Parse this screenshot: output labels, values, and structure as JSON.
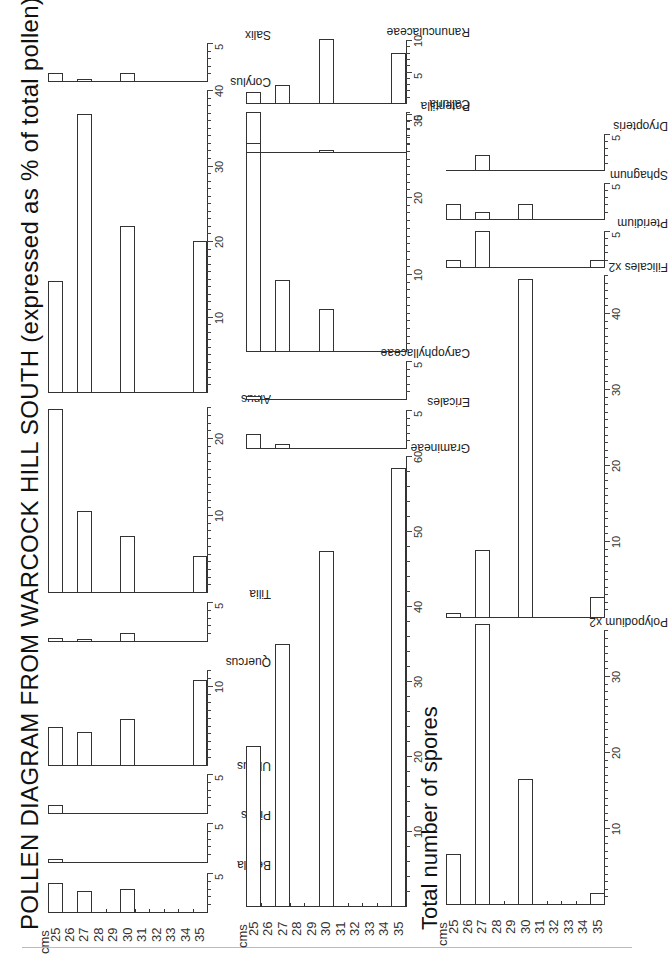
{
  "title": "POLLEN DIAGRAM FROM WARCOCK HILL SOUTH (expressed as % of total pollen)",
  "spores_title": "Total number of spores",
  "depth_unit_label": "cms",
  "chart_data": {
    "type": "bar",
    "title": "POLLEN DIAGRAM FROM WARCOCK HILL SOUTH (expressed as % of total pollen)",
    "orientation": "figure rotated 90deg counter-clockwise; depth axis horizontal, values increase upward",
    "xlabel": "cms",
    "depths": [
      25,
      26,
      27,
      28,
      29,
      30,
      31,
      32,
      33,
      34,
      35
    ],
    "columns": [
      {
        "name": "trees-shrubs",
        "x0": 48,
        "step": 14.45,
        "panels": [
          {
            "taxon": "Betula",
            "baseline": 912,
            "ppu": 7.8,
            "max_tick": 5,
            "minor": 1,
            "label_ticks": [
              5
            ],
            "values": {
              "25": 3.7,
              "27": 2.7,
              "30": 3.0
            }
          },
          {
            "taxon": "Pinus",
            "baseline": 862,
            "ppu": 7.8,
            "max_tick": 5,
            "minor": 1,
            "label_ticks": [
              5
            ],
            "values": {
              "25": 0.4
            }
          },
          {
            "taxon": "Ulmus",
            "baseline": 813,
            "ppu": 7.8,
            "max_tick": 5,
            "minor": 1,
            "label_ticks": [
              5
            ],
            "values": {
              "25": 1.0
            }
          },
          {
            "taxon": "Quercus",
            "baseline": 765,
            "ppu": 7.9,
            "max_tick": 12,
            "minor": 1,
            "label_ticks": [
              10
            ],
            "values": {
              "25": 4.8,
              "27": 4.2,
              "30": 5.8,
              "35": 10.8
            }
          },
          {
            "taxon": "Tilia",
            "baseline": 641,
            "ppu": 7.8,
            "max_tick": 5,
            "minor": 1,
            "label_ticks": [
              5
            ],
            "values": {
              "25": 0.4,
              "27": 0.3,
              "30": 1.0
            }
          },
          {
            "taxon": "Alnus",
            "baseline": 592,
            "ppu": 7.7,
            "max_tick": 24,
            "minor": 1,
            "label_ticks": [
              10,
              20
            ],
            "values": {
              "25": 23.8,
              "27": 10.5,
              "30": 7.3,
              "35": 4.7
            }
          },
          {
            "taxon": "Corylus",
            "baseline": 392,
            "ppu": 7.55,
            "max_tick": 40,
            "minor": 1,
            "label_ticks": [
              10,
              20,
              30,
              40
            ],
            "values": {
              "25": 14.7,
              "27": 36.8,
              "30": 22.0,
              "35": 20.0
            }
          },
          {
            "taxon": "Salix",
            "baseline": 81,
            "ppu": 7.6,
            "max_tick": 5,
            "minor": 1,
            "label_ticks": [
              5
            ],
            "values": {
              "25": 1.0,
              "27": 0.3,
              "30": 1.0
            }
          }
        ]
      },
      {
        "name": "herbs",
        "x0": 246,
        "step": 14.5,
        "panels": [
          {
            "taxon": "Gramineae",
            "baseline": 906,
            "ppu": 7.5,
            "max_tick": 60,
            "minor": 2,
            "label_ticks": [
              10,
              20,
              30,
              40,
              50,
              60
            ],
            "values": {
              "25": 21.3,
              "27": 34.9,
              "30": 47.3,
              "35": 58.4
            }
          },
          {
            "taxon": "Ericales",
            "baseline": 448,
            "ppu": 7.6,
            "max_tick": 5,
            "minor": 1,
            "label_ticks": [
              5
            ],
            "values": {
              "25": 1.8,
              "27": 0.5
            }
          },
          {
            "taxon": "Caryophyllaceae",
            "baseline": 399,
            "ppu": 7.6,
            "max_tick": 5,
            "minor": 1,
            "label_ticks": [
              5
            ],
            "values": {
              "25": 0.4
            }
          },
          {
            "taxon": "Calluna",
            "baseline": 351,
            "ppu": 7.7,
            "max_tick": 31,
            "minor": 1,
            "label_ticks": [
              10,
              20,
              30
            ],
            "values": {
              "25": 31.0,
              "27": 9.2,
              "30": 5.4
            }
          },
          {
            "taxon": "Potentilla",
            "baseline": 152,
            "ppu": 7.7,
            "max_tick": 5,
            "minor": 1,
            "label_ticks": [
              5
            ],
            "values": {
              "25": 1.2,
              "30": 0.3
            }
          },
          {
            "taxon": "Ranunculaceae",
            "baseline": 103,
            "ppu": 6.3,
            "max_tick": 10,
            "minor": 1,
            "label_ticks": [
              5,
              10
            ],
            "values": {
              "25": 1.7,
              "27": 2.9,
              "30": 10.1,
              "35": 7.9
            }
          }
        ]
      },
      {
        "name": "spores",
        "x0": 446,
        "step": 14.4,
        "panels": [
          {
            "taxon": "Polypodium x2",
            "baseline": 904,
            "ppu": 7.6,
            "max_tick": 36,
            "minor": 1,
            "label_ticks": [
              10,
              20,
              30
            ],
            "values": {
              "25": 6.6,
              "27": 36.9,
              "30": 16.5,
              "35": 1.4
            }
          },
          {
            "taxon": "Filicales x2",
            "baseline": 617,
            "ppu": 7.6,
            "max_tick": 45,
            "minor": 1,
            "label_ticks": [
              10,
              20,
              30,
              40
            ],
            "values": {
              "25": 0.5,
              "27": 8.8,
              "30": 44.5,
              "35": 2.6
            }
          },
          {
            "taxon": "Pteridium",
            "baseline": 267,
            "ppu": 7.3,
            "max_tick": 5,
            "minor": 1,
            "label_ticks": [
              5
            ],
            "values": {
              "25": 1.0,
              "27": 5.0,
              "35": 1.0
            }
          },
          {
            "taxon": "Sphagnum",
            "baseline": 219,
            "ppu": 7.3,
            "max_tick": 5,
            "minor": 1,
            "label_ticks": [
              5
            ],
            "values": {
              "25": 2.0,
              "27": 1.0,
              "30": 2.0
            }
          },
          {
            "taxon": "Dryopteris",
            "baseline": 170,
            "ppu": 7.3,
            "max_tick": 5,
            "minor": 1,
            "label_ticks": [
              5
            ],
            "values": {
              "27": 2.0
            }
          }
        ]
      }
    ]
  }
}
